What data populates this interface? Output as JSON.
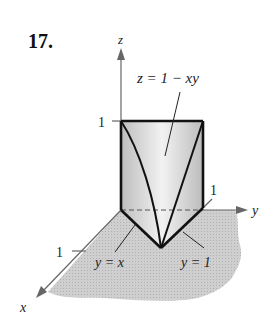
{
  "problem_number": "17.",
  "axes": {
    "z_label": "z",
    "y_label": "y",
    "x_label": "x",
    "z_tick": "1",
    "y_tick": "1",
    "x_tick": "1"
  },
  "annotations": {
    "surface": "z = 1 − xy",
    "curve_left": "y = x",
    "curve_right": "y = 1"
  },
  "colors": {
    "line": "#111111",
    "axis": "#555555",
    "ground": "#c8c8c8",
    "solid_fill": "#d9d9d9"
  }
}
